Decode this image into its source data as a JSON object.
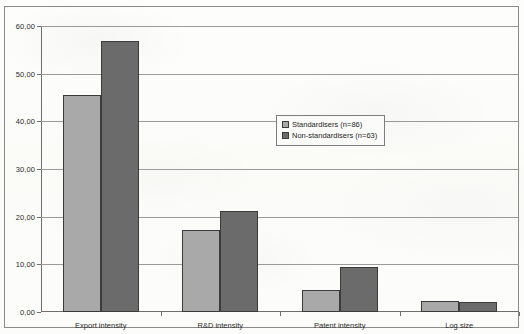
{
  "chart_data": {
    "type": "bar",
    "title": "",
    "subtitle": "",
    "xlabel": "",
    "ylabel": "",
    "categories": [
      "Export intensity",
      "R&D intensity",
      "Patent intensity",
      "Log size"
    ],
    "series": [
      {
        "name": "Standardisers (n=86)",
        "values": [
          45.6,
          17.3,
          4.6,
          2.4
        ],
        "color": "#a9a9a9"
      },
      {
        "name": "Non-standardisers (n=63)",
        "values": [
          56.9,
          21.1,
          9.4,
          2.0
        ],
        "color": "#6b6b6b"
      }
    ],
    "ylim": [
      0,
      60
    ],
    "ytick_values": [
      0,
      10,
      20,
      30,
      40,
      50,
      60
    ],
    "ytick_labels": [
      "0,00",
      "10,00",
      "20,00",
      "30,00",
      "40,00",
      "50,00",
      "60,00"
    ],
    "grid": true,
    "legend_position": "center-right"
  },
  "legend": {
    "entries": [
      {
        "label": "Standardisers (n=86)",
        "swatch": "light"
      },
      {
        "label": "Non-standardisers (n=63)",
        "swatch": "dark"
      }
    ]
  }
}
